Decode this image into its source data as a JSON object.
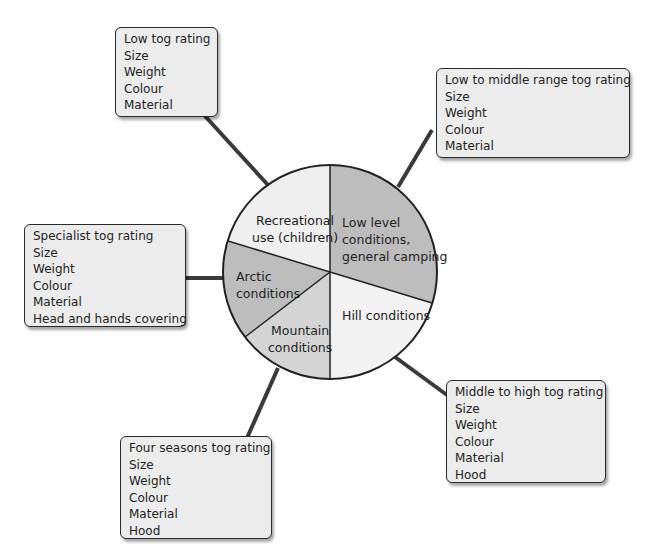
{
  "pie": {
    "center": [
      330,
      272
    ],
    "radius": 107,
    "segments": [
      {
        "label_lines": [
          "Low level",
          "conditions,",
          "general camping"
        ],
        "fill": "#bdbdbd"
      },
      {
        "label_lines": [
          "Hill conditions"
        ],
        "fill": "#f2f2f2"
      },
      {
        "label_lines": [
          "Mountain",
          "conditions"
        ],
        "fill": "#d4d4d4"
      },
      {
        "label_lines": [
          "Arctic",
          "conditions"
        ],
        "fill": "#bdbdbd"
      },
      {
        "label_lines": [
          "Recreational",
          "use (children)"
        ],
        "fill": "#efefef"
      }
    ]
  },
  "boxes": [
    {
      "id": "recreational",
      "lines": [
        "Low tog rating",
        "Size",
        "Weight",
        "Colour",
        "Material"
      ]
    },
    {
      "id": "low-level",
      "lines": [
        "Low to middle range tog rating",
        "Size",
        "Weight",
        "Colour",
        "Material"
      ]
    },
    {
      "id": "arctic",
      "lines": [
        "Specialist tog rating",
        "Size",
        "Weight",
        "Colour",
        "Material",
        "Head and hands covering"
      ]
    },
    {
      "id": "hill",
      "lines": [
        "Middle to high tog rating",
        "Size",
        "Weight",
        "Colour",
        "Material",
        "Hood"
      ]
    },
    {
      "id": "mountain",
      "lines": [
        "Four seasons tog rating",
        "Size",
        "Weight",
        "Colour",
        "Material",
        "Hood"
      ]
    }
  ],
  "colors": {
    "line": "#3a3a3a",
    "box_fill": "#ececec",
    "box_border": "#2a2a2a"
  }
}
